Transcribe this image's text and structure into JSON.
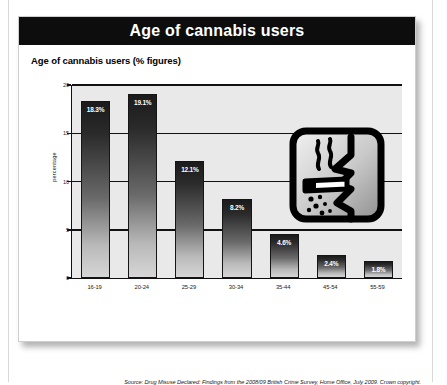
{
  "header": {
    "title": "Age of cannabis users"
  },
  "subtitle": "Age of cannabis users (% figures)",
  "source": "Source: Drug Misuse Declared: Findings from the 2008/09 British Crime Survey, Home Office, July 2009. Crown copyright.",
  "illustration": {
    "name": "smoking-joint-icon",
    "description": "Hand-drawn face in profile smoking a joint with smoke wisps and falling ash"
  },
  "chart_data": {
    "type": "bar",
    "title": "Age of cannabis users (% figures)",
    "xlabel": "",
    "ylabel": "percentage",
    "categories": [
      "16-19",
      "20-24",
      "25-29",
      "30-34",
      "35-44",
      "45-54",
      "55-59"
    ],
    "values": [
      18.3,
      19.1,
      12.1,
      8.2,
      4.6,
      2.4,
      1.8
    ],
    "data_labels": [
      "18.3%",
      "19.1%",
      "12.1%",
      "8.2%",
      "4.6%",
      "2.4%",
      "1.8%"
    ],
    "ylim": [
      0,
      20
    ],
    "yticks": [
      0,
      5,
      10,
      15,
      20
    ],
    "ytick_labels": [
      "0",
      "5",
      "10",
      "15",
      "20"
    ],
    "grid": true,
    "legend": false,
    "colors": {
      "bar_top": "#1b1b1b",
      "bar_bottom": "#d6d6d6",
      "plot_background": "#e9e9e9",
      "axis": "#111111",
      "header_background": "#0d0d0d",
      "header_text": "#ffffff"
    }
  }
}
